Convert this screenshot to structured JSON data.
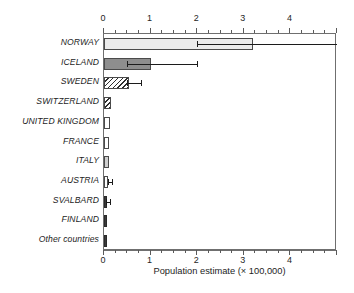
{
  "chart_data": {
    "type": "bar",
    "orientation": "horizontal",
    "title": "",
    "xlabel": "Population estimate (× 100,000)",
    "ylabel": "",
    "xlim": [
      0,
      5.0
    ],
    "xticks": [
      0,
      1,
      2,
      3,
      4
    ],
    "xticklabels": [
      "0",
      "1",
      "2",
      "3",
      "4"
    ],
    "minor_tick_step": 0.25,
    "grid": false,
    "legend": "none",
    "axis_positions": [
      "top",
      "bottom"
    ],
    "categories": [
      "NORWAY",
      "ICELAND",
      "SWEDEN",
      "SWITZERLAND",
      "UNITED KINGDOM",
      "FRANCE",
      "ITALY",
      "AUSTRIA",
      "SVALBARD",
      "FINLAND",
      "Other countries"
    ],
    "values": [
      3.2,
      1.0,
      0.53,
      0.15,
      0.12,
      0.1,
      0.1,
      0.08,
      0.05,
      0.03,
      0.03
    ],
    "error_low": [
      2.0,
      0.5,
      0.5,
      null,
      null,
      null,
      null,
      0.08,
      0.05,
      null,
      null
    ],
    "error_high": [
      5.0,
      2.0,
      0.8,
      null,
      null,
      null,
      null,
      0.18,
      0.13,
      null,
      null
    ],
    "bar_styles": [
      "very-light-gray",
      "medium-gray",
      "diagonal-hatch",
      "diagonal-hatch",
      "white",
      "white",
      "light-gray",
      "white",
      "dark",
      "dark",
      "dark"
    ],
    "colors": {
      "very-light-gray": "#ebebeb",
      "medium-gray": "#8e8e8e",
      "light-gray": "#cfcfcf",
      "white": "#ffffff",
      "dark": "#3a3a3a",
      "outline": "#4a4a4a",
      "axis": "#6f6f6f",
      "text": "#1d1d1d"
    }
  }
}
